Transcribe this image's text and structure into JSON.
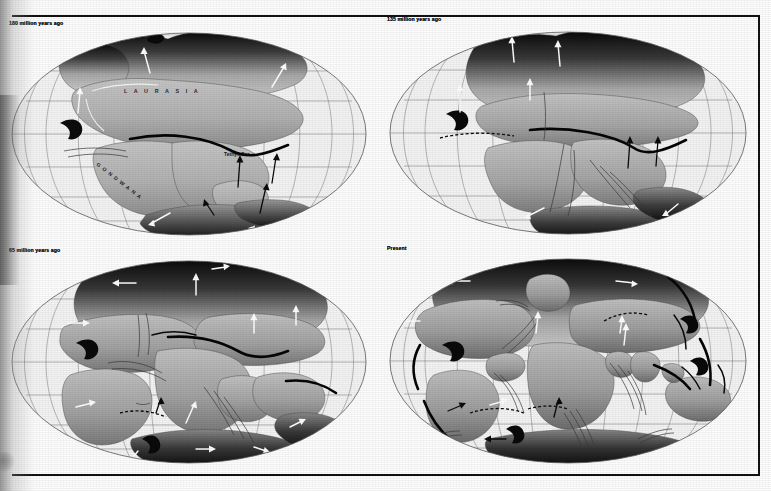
{
  "figure": {
    "projection": "Mollweide elliptical world projection",
    "style": "black-and-white scanned halftone plate",
    "rules": {
      "top_rule": "horizontal rule",
      "bottom_rule": "horizontal rule",
      "right_rule": "vertical rule"
    }
  },
  "panels": [
    {
      "id": "panel-a",
      "label": "180 million years ago",
      "position": "top-left",
      "map_labels": [
        {
          "text": "L A U R A S I A",
          "kind": "supercontinent",
          "x": 196,
          "y": 63
        },
        {
          "text": "GONDWANA",
          "kind": "supercontinent",
          "x": 108,
          "y": 150,
          "rotated": true
        },
        {
          "text": "Tethys Sea",
          "kind": "ocean",
          "x": 246,
          "y": 123
        }
      ],
      "features": [
        "Pangaea split into Laurasia and Gondwana",
        "Tethys Sea",
        "subduction trench",
        "plate motion arrows"
      ]
    },
    {
      "id": "panel-b",
      "label": "135 million years ago",
      "position": "top-right",
      "map_labels": [],
      "features": [
        "North Atlantic opening",
        "South Atlantic rift",
        "Tethys trench",
        "plate motion arrows"
      ]
    },
    {
      "id": "panel-c",
      "label": "65 million years ago",
      "position": "bottom-left",
      "map_labels": [],
      "features": [
        "Atlantic Ocean widened",
        "India moving north",
        "Madagascar separated",
        "mid-ocean ridges"
      ]
    },
    {
      "id": "panel-d",
      "label": "Present",
      "position": "bottom-right",
      "map_labels": [],
      "features": [
        "Modern continents",
        "mid-ocean ridge system",
        "circum-Pacific trenches",
        "transform faults",
        "plate motion arrows"
      ]
    }
  ],
  "colors": {
    "paper": "#fefefe",
    "ink": "#111111",
    "ocean": "#f4f4f4",
    "graticule": "#6e6e70",
    "land_light": "#c9c9c9",
    "land_dark": "#2a2a2a",
    "trench": "#060606",
    "arrow_white": "#ffffff",
    "arrow_black": "#0b0b0b"
  }
}
